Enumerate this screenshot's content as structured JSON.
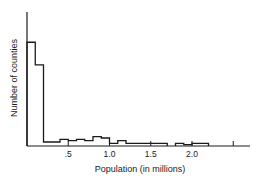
{
  "chart_data": {
    "type": "bar",
    "style": "step-histogram",
    "title": "",
    "xlabel": "Population (in millions)",
    "ylabel": "Number of counties",
    "x_tick_labels": [
      ".5",
      "1.0",
      "1.5",
      "2.0",
      ""
    ],
    "x_ticks": [
      0.5,
      1.0,
      1.5,
      2.0,
      2.5
    ],
    "xlim": [
      0,
      2.7
    ],
    "ylim": [
      0,
      100
    ],
    "y_ticks_shown": false,
    "grid": false,
    "legend": null,
    "bin_width": 0.1,
    "bins": [
      {
        "x0": 0.0,
        "x1": 0.1,
        "value": 78
      },
      {
        "x0": 0.1,
        "x1": 0.2,
        "value": 61
      },
      {
        "x0": 0.2,
        "x1": 0.3,
        "value": 3
      },
      {
        "x0": 0.3,
        "x1": 0.4,
        "value": 3
      },
      {
        "x0": 0.4,
        "x1": 0.5,
        "value": 5
      },
      {
        "x0": 0.5,
        "x1": 0.6,
        "value": 4
      },
      {
        "x0": 0.6,
        "x1": 0.7,
        "value": 5
      },
      {
        "x0": 0.7,
        "x1": 0.8,
        "value": 4
      },
      {
        "x0": 0.8,
        "x1": 0.9,
        "value": 7
      },
      {
        "x0": 0.9,
        "x1": 1.0,
        "value": 6
      },
      {
        "x0": 1.0,
        "x1": 1.1,
        "value": 2
      },
      {
        "x0": 1.1,
        "x1": 1.2,
        "value": 4
      },
      {
        "x0": 1.2,
        "x1": 1.3,
        "value": 2
      },
      {
        "x0": 1.3,
        "x1": 1.4,
        "value": 2
      },
      {
        "x0": 1.4,
        "x1": 1.5,
        "value": 2
      },
      {
        "x0": 1.5,
        "x1": 1.6,
        "value": 2
      },
      {
        "x0": 1.6,
        "x1": 1.7,
        "value": 2
      },
      {
        "x0": 1.7,
        "x1": 1.8,
        "value": 0
      },
      {
        "x0": 1.8,
        "x1": 1.9,
        "value": 2
      },
      {
        "x0": 1.9,
        "x1": 2.0,
        "value": 1
      },
      {
        "x0": 2.0,
        "x1": 2.1,
        "value": 2
      },
      {
        "x0": 2.1,
        "x1": 2.2,
        "value": 2
      }
    ]
  },
  "colors": {
    "line": "#1a1a1a",
    "background": "#ffffff"
  }
}
